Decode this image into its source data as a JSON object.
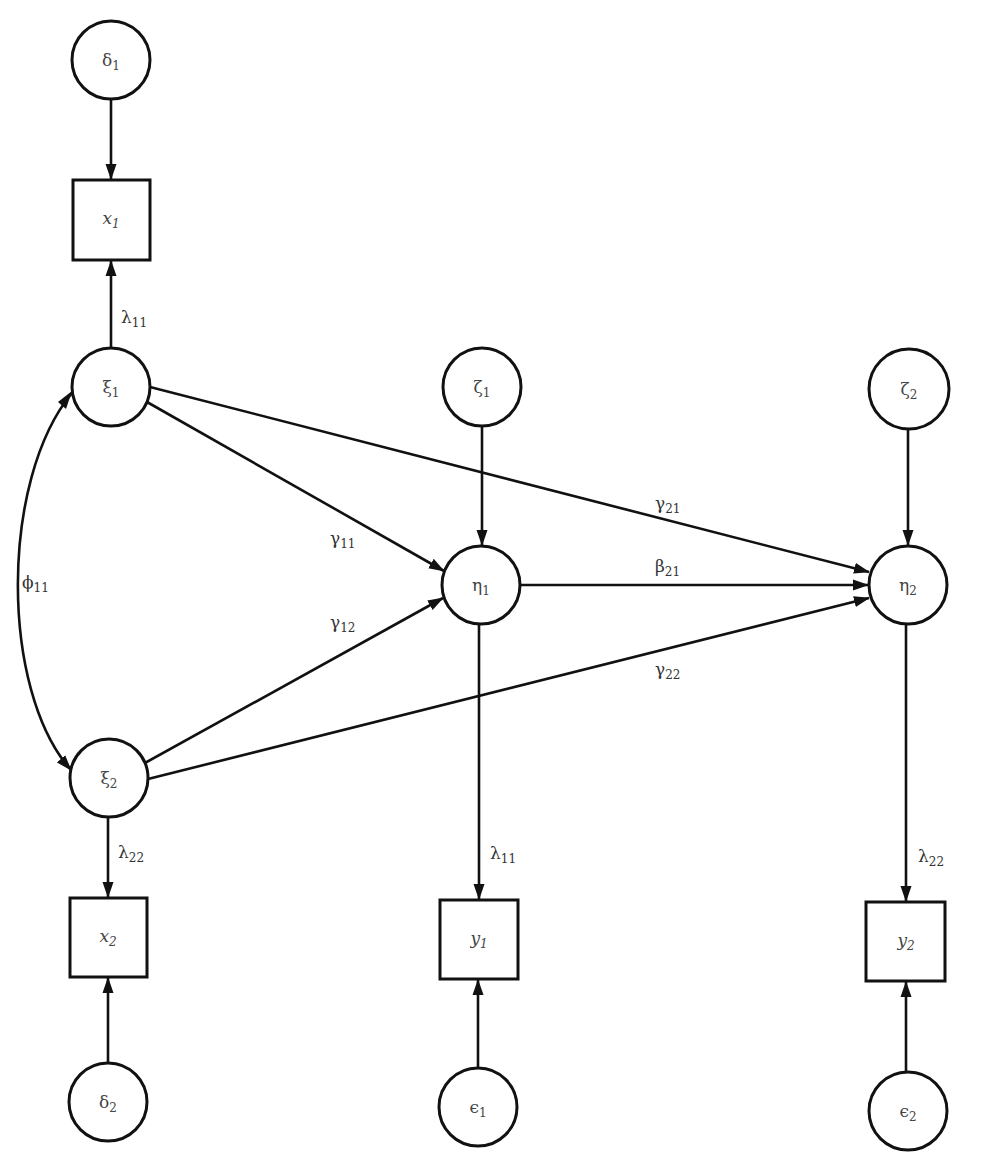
{
  "diagram": {
    "type": "structural-equation-model-path-diagram",
    "colors": {
      "stroke": "#111111",
      "text": "#444444",
      "background": "#ffffff"
    },
    "nodes": {
      "delta1": {
        "symbol": "δ",
        "sub": "1",
        "shape": "circle",
        "cx": 111,
        "cy": 60,
        "r": 39
      },
      "x1": {
        "symbol": "x",
        "sub": "1",
        "shape": "box",
        "x": 73,
        "y": 180,
        "w": 77,
        "h": 80
      },
      "xi1": {
        "symbol": "ξ",
        "sub": "1",
        "shape": "circle",
        "cx": 111,
        "cy": 387,
        "r": 39
      },
      "xi2": {
        "symbol": "ξ",
        "sub": "2",
        "shape": "circle",
        "cx": 109,
        "cy": 778,
        "r": 39
      },
      "x2": {
        "symbol": "x",
        "sub": "2",
        "shape": "box",
        "x": 70,
        "y": 898,
        "w": 77,
        "h": 79
      },
      "delta2": {
        "symbol": "δ",
        "sub": "2",
        "shape": "circle",
        "cx": 108,
        "cy": 1102,
        "r": 39
      },
      "zeta1": {
        "symbol": "ζ",
        "sub": "1",
        "shape": "circle",
        "cx": 482,
        "cy": 387,
        "r": 39
      },
      "eta1": {
        "symbol": "η",
        "sub": "1",
        "shape": "circle",
        "cx": 481,
        "cy": 585,
        "r": 39
      },
      "y1": {
        "symbol": "y",
        "sub": "1",
        "shape": "box",
        "x": 440,
        "y": 900,
        "w": 78,
        "h": 79
      },
      "eps1": {
        "symbol": "ϵ",
        "sub": "1",
        "shape": "circle",
        "cx": 478,
        "cy": 1107,
        "r": 39
      },
      "zeta2": {
        "symbol": "ζ",
        "sub": "2",
        "shape": "circle",
        "cx": 909,
        "cy": 389,
        "r": 40
      },
      "eta2": {
        "symbol": "η",
        "sub": "2",
        "shape": "circle",
        "cx": 908,
        "cy": 585,
        "r": 39
      },
      "y2": {
        "symbol": "y",
        "sub": "2",
        "shape": "box",
        "x": 866,
        "y": 902,
        "w": 79,
        "h": 79
      },
      "eps2": {
        "symbol": "ϵ",
        "sub": "2",
        "shape": "circle",
        "cx": 908,
        "cy": 1111,
        "r": 39
      }
    },
    "edges": [
      {
        "from": "delta1",
        "to": "x1",
        "label": ""
      },
      {
        "from": "xi1",
        "to": "x1",
        "label": "λ",
        "sub": "11"
      },
      {
        "from": "xi1",
        "to": "eta1",
        "label": "γ",
        "sub": "11"
      },
      {
        "from": "xi1",
        "to": "eta2",
        "label": "γ",
        "sub": "21"
      },
      {
        "from": "xi2",
        "to": "eta1",
        "label": "γ",
        "sub": "12"
      },
      {
        "from": "xi2",
        "to": "eta2",
        "label": "γ",
        "sub": "22"
      },
      {
        "from": "xi2",
        "to": "x2",
        "label": "λ",
        "sub": "22"
      },
      {
        "from": "delta2",
        "to": "x2",
        "label": ""
      },
      {
        "from": "zeta1",
        "to": "eta1",
        "label": ""
      },
      {
        "from": "eta1",
        "to": "eta2",
        "label": "β",
        "sub": "21"
      },
      {
        "from": "eta1",
        "to": "y1",
        "label": "λ",
        "sub": "11"
      },
      {
        "from": "eps1",
        "to": "y1",
        "label": ""
      },
      {
        "from": "zeta2",
        "to": "eta2",
        "label": ""
      },
      {
        "from": "eta2",
        "to": "y2",
        "label": "λ",
        "sub": "22"
      },
      {
        "from": "eps2",
        "to": "y2",
        "label": ""
      },
      {
        "from": "xi1",
        "to": "xi2",
        "label": "ϕ",
        "sub": "11",
        "bidirectional": true,
        "curved": true
      }
    ],
    "labels": {
      "delta1": {
        "main": "δ",
        "sub": "1"
      },
      "x1": {
        "main": "x",
        "sub": "1"
      },
      "xi1": {
        "main": "ξ",
        "sub": "1"
      },
      "xi2": {
        "main": "ξ",
        "sub": "2"
      },
      "x2": {
        "main": "x",
        "sub": "2"
      },
      "delta2": {
        "main": "δ",
        "sub": "2"
      },
      "zeta1": {
        "main": "ζ",
        "sub": "1"
      },
      "eta1": {
        "main": "η",
        "sub": "1"
      },
      "y1": {
        "main": "y",
        "sub": "1"
      },
      "eps1": {
        "main": "ϵ",
        "sub": "1"
      },
      "zeta2": {
        "main": "ζ",
        "sub": "2"
      },
      "eta2": {
        "main": "η",
        "sub": "2"
      },
      "y2": {
        "main": "y",
        "sub": "2"
      },
      "eps2": {
        "main": "ϵ",
        "sub": "2"
      },
      "lambda11_x": {
        "main": "λ",
        "sub": "11"
      },
      "lambda22_x": {
        "main": "λ",
        "sub": "22"
      },
      "lambda11_y": {
        "main": "λ",
        "sub": "11"
      },
      "lambda22_y": {
        "main": "λ",
        "sub": "22"
      },
      "gamma11": {
        "main": "γ",
        "sub": "11"
      },
      "gamma12": {
        "main": "γ",
        "sub": "12"
      },
      "gamma21": {
        "main": "γ",
        "sub": "21"
      },
      "gamma22": {
        "main": "γ",
        "sub": "22"
      },
      "beta21": {
        "main": "β",
        "sub": "21"
      },
      "phi11": {
        "main": "ϕ",
        "sub": "11"
      }
    }
  }
}
